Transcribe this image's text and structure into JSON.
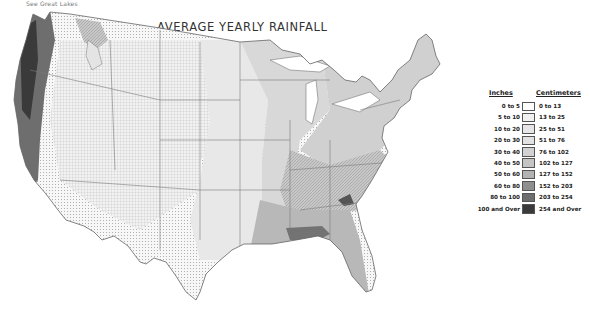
{
  "header": {
    "note": "See Great Lakes",
    "title": "AVERAGE YEARLY RAINFALL"
  },
  "legend": {
    "inches_header": "Inches",
    "cm_header": "Centimeters",
    "rows": [
      {
        "inches": "0 to 5",
        "cm": "0 to 13",
        "color": "#ffffff"
      },
      {
        "inches": "5 to 10",
        "cm": "13 to 25",
        "color": "#f1f1f1"
      },
      {
        "inches": "10 to 20",
        "cm": "25 to 51",
        "color": "#e6e6e6"
      },
      {
        "inches": "20 to 30",
        "cm": "51 to 76",
        "color": "#e2e2e2"
      },
      {
        "inches": "30 to 40",
        "cm": "76 to 102",
        "color": "#d2d2d2"
      },
      {
        "inches": "40 to 50",
        "cm": "102 to 127",
        "color": "#c4c4c4"
      },
      {
        "inches": "50 to 60",
        "cm": "127 to 152",
        "color": "#b3b3b3"
      },
      {
        "inches": "60 to 80",
        "cm": "152 to 203",
        "color": "#8f8f8f"
      },
      {
        "inches": "80 to 100",
        "cm": "203 to 254",
        "color": "#6e6e6e"
      },
      {
        "inches": "100 and Over",
        "cm": "254 and Over",
        "color": "#3a3a3a"
      }
    ]
  },
  "map": {
    "region": "Contiguous United States",
    "colors": {
      "outline": "#666666",
      "state_line": "#7a7a7a"
    }
  }
}
